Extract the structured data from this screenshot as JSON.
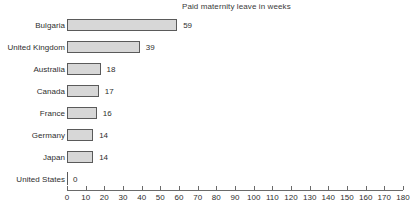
{
  "chart_data": {
    "type": "bar",
    "orientation": "horizontal",
    "title": "Paid maternity leave in weeks",
    "xlabel": "",
    "ylabel": "",
    "xlim": [
      0,
      180
    ],
    "xticks": [
      0,
      10,
      20,
      30,
      40,
      50,
      60,
      70,
      80,
      90,
      100,
      110,
      120,
      130,
      140,
      150,
      160,
      170,
      180
    ],
    "grid": false,
    "legend": null,
    "categories": [
      "Bulgaria",
      "United Kingdom",
      "Australia",
      "Canada",
      "France",
      "Germany",
      "Japan",
      "United States"
    ],
    "values": [
      59,
      39,
      18,
      17,
      16,
      14,
      14,
      0
    ],
    "value_labels": [
      "59",
      "39",
      "18",
      "17",
      "16",
      "14",
      "14",
      "0"
    ],
    "bar_fill_color": "#d7d7d7",
    "bar_border_color": "#5a5a5a",
    "axis_color": "#6a6a6a",
    "text_color": "#2e2e2e"
  },
  "footnote": ""
}
